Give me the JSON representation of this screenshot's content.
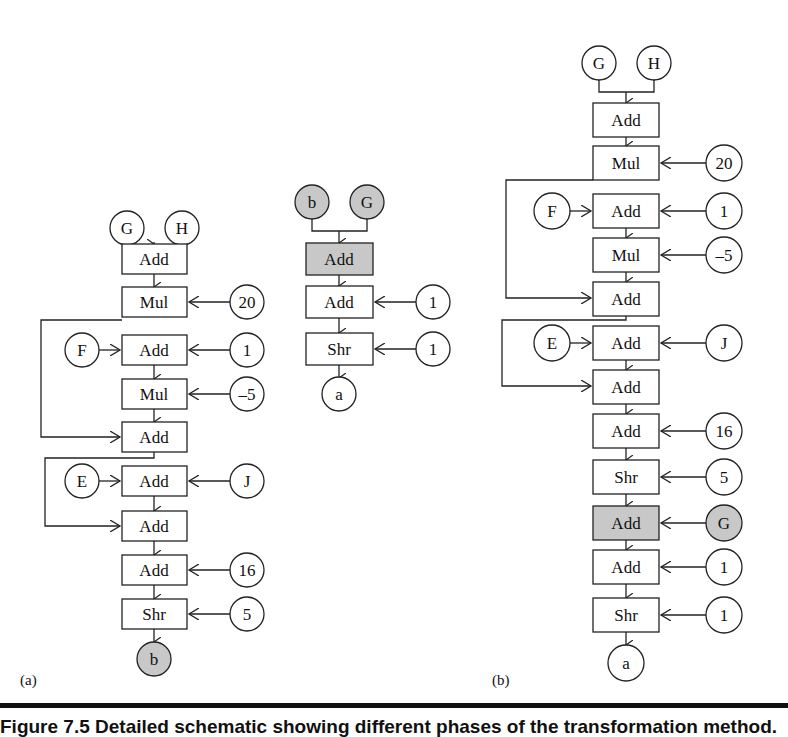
{
  "panels": {
    "a": {
      "label": "(a)",
      "inputs_top": [
        "G",
        "H"
      ],
      "ops": [
        {
          "op": "Add",
          "side_input": null,
          "left_input": null
        },
        {
          "op": "Mul",
          "side_input": "20",
          "left_input": null
        },
        {
          "op": "Add",
          "side_input": "1",
          "left_input": "F"
        },
        {
          "op": "Mul",
          "side_input": "–5",
          "left_input": null
        },
        {
          "op": "Add",
          "side_input": null,
          "left_input": null
        },
        {
          "op": "Add",
          "side_input": "J",
          "left_input": "E"
        },
        {
          "op": "Add",
          "side_input": null,
          "left_input": null
        },
        {
          "op": "Add",
          "side_input": "16",
          "left_input": null
        },
        {
          "op": "Shr",
          "side_input": "5",
          "left_input": null
        }
      ],
      "output": "b"
    },
    "a2": {
      "inputs_top": [
        "b",
        "G"
      ],
      "ops": [
        {
          "op": "Add",
          "side_input": null,
          "highlighted": true
        },
        {
          "op": "Add",
          "side_input": "1"
        },
        {
          "op": "Shr",
          "side_input": "1"
        }
      ],
      "output": "a"
    },
    "b": {
      "label": "(b)",
      "inputs_top": [
        "G",
        "H"
      ],
      "ops": [
        {
          "op": "Add",
          "side_input": null,
          "left_input": null
        },
        {
          "op": "Mul",
          "side_input": "20",
          "left_input": null
        },
        {
          "op": "Add",
          "side_input": "1",
          "left_input": "F"
        },
        {
          "op": "Mul",
          "side_input": "–5",
          "left_input": null
        },
        {
          "op": "Add",
          "side_input": null,
          "left_input": null
        },
        {
          "op": "Add",
          "side_input": "J",
          "left_input": "E"
        },
        {
          "op": "Add",
          "side_input": null,
          "left_input": null
        },
        {
          "op": "Add",
          "side_input": "16",
          "left_input": null
        },
        {
          "op": "Shr",
          "side_input": "5",
          "left_input": null
        },
        {
          "op": "Add",
          "side_input": "G",
          "left_input": null,
          "highlighted": true
        },
        {
          "op": "Add",
          "side_input": "1",
          "left_input": null
        },
        {
          "op": "Shr",
          "side_input": "1",
          "left_input": null
        }
      ],
      "output": "a"
    }
  },
  "caption": "Figure 7.5   Detailed schematic showing different phases of the transformation method."
}
